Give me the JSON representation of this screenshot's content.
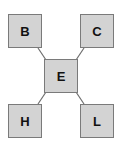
{
  "diagram": {
    "nodes": [
      {
        "id": "B",
        "label": "B",
        "x": 8,
        "y": 14
      },
      {
        "id": "C",
        "label": "C",
        "x": 80,
        "y": 14
      },
      {
        "id": "E",
        "label": "E",
        "x": 44,
        "y": 59
      },
      {
        "id": "H",
        "label": "H",
        "x": 8,
        "y": 104
      },
      {
        "id": "L",
        "label": "L",
        "x": 80,
        "y": 104
      }
    ],
    "edges": [
      [
        "B",
        "E"
      ],
      [
        "C",
        "E"
      ],
      [
        "H",
        "E"
      ],
      [
        "L",
        "E"
      ]
    ],
    "colors": {
      "node_fill": "#d3d3d3",
      "node_border": "#7a7a7a",
      "edge": "#6e6e6e"
    }
  }
}
